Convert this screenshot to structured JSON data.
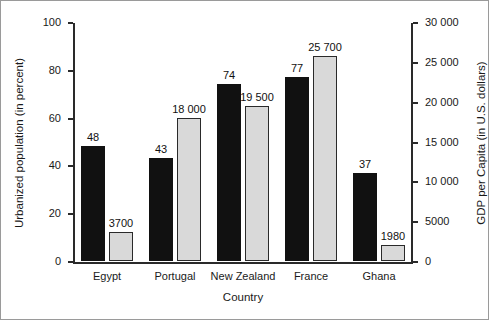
{
  "chart_data": {
    "type": "bar",
    "title": "",
    "xlabel": "Country",
    "categories": [
      "Egypt",
      "Portugal",
      "New Zealand",
      "France",
      "Ghana"
    ],
    "series": [
      {
        "name": "Urbanized population (in percent)",
        "axis": "left",
        "values": [
          48,
          43,
          74,
          77,
          37
        ],
        "value_labels": [
          "48",
          "43",
          "74",
          "77",
          "37"
        ],
        "color": "#111111",
        "style": "solid-black"
      },
      {
        "name": "GDP per Capita (in U.S. dollars)",
        "axis": "right",
        "values": [
          3700,
          18000,
          19500,
          25700,
          1980
        ],
        "value_labels": [
          "3700",
          "18 000",
          "19 500",
          "25 700",
          "1980"
        ],
        "color": "#d9d9d9",
        "style": "light-gray-outlined"
      }
    ],
    "left_axis": {
      "label": "Urbanized population (in percent)",
      "ticks": [
        0,
        20,
        40,
        60,
        80,
        100
      ],
      "tick_labels": [
        "0",
        "20",
        "40",
        "60",
        "80",
        "100"
      ],
      "min": 0,
      "max": 100
    },
    "right_axis": {
      "label": "GDP per Capita (in U.S. dollars)",
      "ticks": [
        0,
        5000,
        10000,
        15000,
        20000,
        25000,
        30000
      ],
      "tick_labels": [
        "0",
        "5000",
        "10 000",
        "15 000",
        "20 000",
        "25 000",
        "30 000"
      ],
      "min": 0,
      "max": 30000
    },
    "grid": false,
    "legend": "none"
  },
  "colors": {
    "axis": "#2a2a2a",
    "bar_dark": "#111111",
    "bar_light": "#d9d9d9",
    "bar_light_border": "#2a2a2a",
    "text": "#1a1a1a",
    "frame_border": "#9a9a9a",
    "background": "#ffffff"
  }
}
